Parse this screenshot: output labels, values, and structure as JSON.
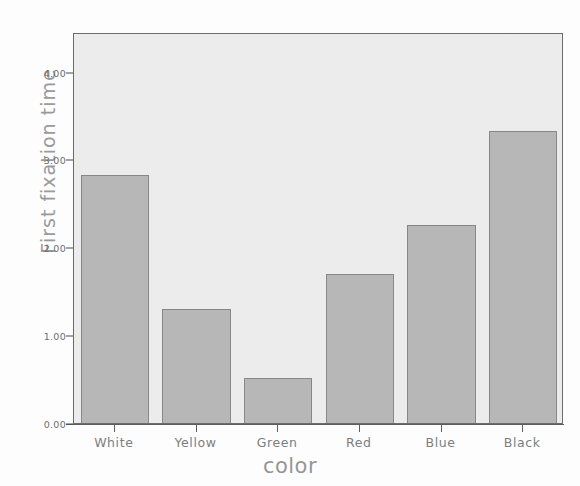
{
  "chart_data": {
    "type": "bar",
    "title": "",
    "xlabel": "color",
    "ylabel": "First fixation time",
    "categories": [
      "White",
      "Yellow",
      "Green",
      "Red",
      "Blue",
      "Black"
    ],
    "values": [
      2.85,
      1.32,
      0.53,
      1.72,
      2.28,
      3.35
    ],
    "ylim": [
      0,
      4.45
    ],
    "yticks": [
      0,
      1,
      2,
      3,
      4
    ],
    "ytick_labels": [
      "0.00",
      "1.00",
      "2.00",
      "3.00",
      "4.00"
    ],
    "grid": false,
    "legend": false,
    "bar_color": "#a8a8a8",
    "bar_edge_color": "#6a6a6a",
    "plot_background": "#eeeeee",
    "axis_color": "#4a4a4a",
    "label_color": "#8a8a8a"
  }
}
